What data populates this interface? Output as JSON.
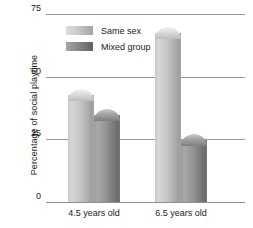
{
  "chart_data": {
    "type": "bar",
    "title": "",
    "xlabel": "",
    "ylabel": "Percentage of social playtime",
    "categories": [
      "4.5 years old",
      "6.5 years old"
    ],
    "series": [
      {
        "name": "Same sex",
        "values": [
          45,
          70
        ],
        "color": "#c6c6c6"
      },
      {
        "name": "Mixed group",
        "values": [
          37,
          27
        ],
        "color": "#8c8c8c"
      }
    ],
    "ylim": [
      0,
      75
    ],
    "yticks": [
      0,
      25,
      50,
      75
    ],
    "ytick_labels": [
      "0",
      "25",
      "50",
      "75"
    ],
    "grid": true,
    "legend_position": "upper-left-inside"
  },
  "axis": {
    "y_title": "Percentage of social playtime",
    "ticks": [
      {
        "label": "75",
        "value": 75
      },
      {
        "label": "50",
        "value": 50
      },
      {
        "label": "25",
        "value": 25
      },
      {
        "label": "0",
        "value": 0
      }
    ]
  },
  "legend": {
    "items": [
      {
        "label": "Same sex",
        "swatch": "light"
      },
      {
        "label": "Mixed group",
        "swatch": "dark"
      }
    ]
  },
  "groups": [
    {
      "label": "4.5 years old"
    },
    {
      "label": "6.5 years old"
    }
  ]
}
